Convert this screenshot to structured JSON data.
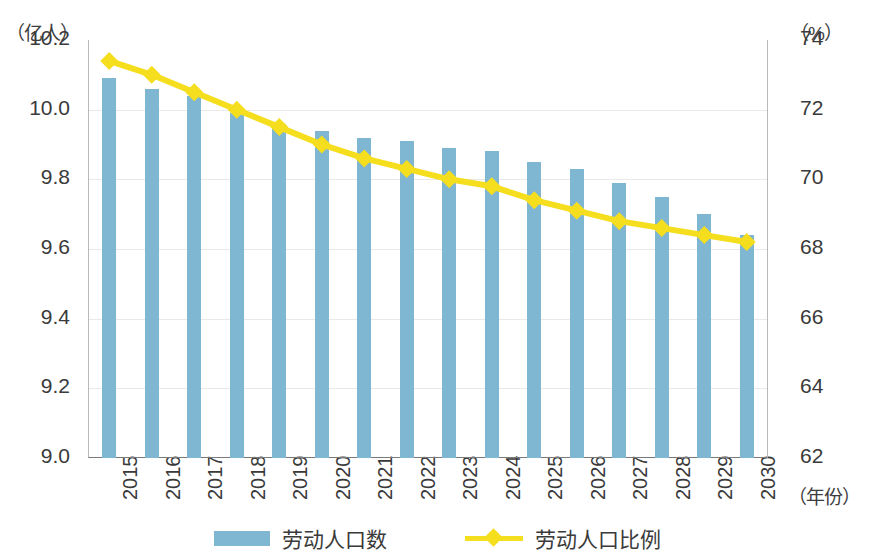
{
  "axes": {
    "left_unit": "（亿人）",
    "right_unit": "（%）",
    "x_unit": "（年份）",
    "left_ticks": [
      "10.2",
      "10.0",
      "9.8",
      "9.6",
      "9.4",
      "9.2",
      "9.0"
    ],
    "right_ticks": [
      "74",
      "72",
      "70",
      "68",
      "66",
      "64",
      "62"
    ]
  },
  "legend": {
    "bar_label": "劳动人口数",
    "line_label": "劳动人口比例"
  },
  "colors": {
    "bar": "#7fb6d1",
    "line": "#f5de1e",
    "axis": "#7a7a7a",
    "grid": "#e9e9e9",
    "text": "#3a3a3a"
  },
  "chart_data": {
    "type": "bar",
    "title": "",
    "subtitle": "",
    "xlabel": "（年份）",
    "ylabel": "（亿人）",
    "y2label": "（%）",
    "grid": true,
    "legend_position": "bottom",
    "categories": [
      "2015",
      "2016",
      "2017",
      "2018",
      "2019",
      "2020",
      "2021",
      "2022",
      "2023",
      "2024",
      "2025",
      "2026",
      "2027",
      "2028",
      "2029",
      "2030"
    ],
    "ylim": [
      9.0,
      10.2
    ],
    "y2lim": [
      62,
      74
    ],
    "series": [
      {
        "name": "劳动人口数",
        "type": "bar",
        "axis": "left",
        "unit": "亿人",
        "color": "#7fb6d1",
        "values": [
          10.09,
          10.06,
          10.04,
          9.99,
          9.96,
          9.94,
          9.92,
          9.91,
          9.89,
          9.88,
          9.85,
          9.83,
          9.79,
          9.75,
          9.7,
          9.64
        ]
      },
      {
        "name": "劳动人口比例",
        "type": "line",
        "axis": "right",
        "unit": "%",
        "color": "#f5de1e",
        "marker": "diamond",
        "values": [
          73.4,
          73.0,
          72.5,
          72.0,
          71.5,
          71.0,
          70.6,
          70.3,
          70.0,
          69.8,
          69.4,
          69.1,
          68.8,
          68.6,
          68.4,
          68.2
        ]
      }
    ]
  }
}
